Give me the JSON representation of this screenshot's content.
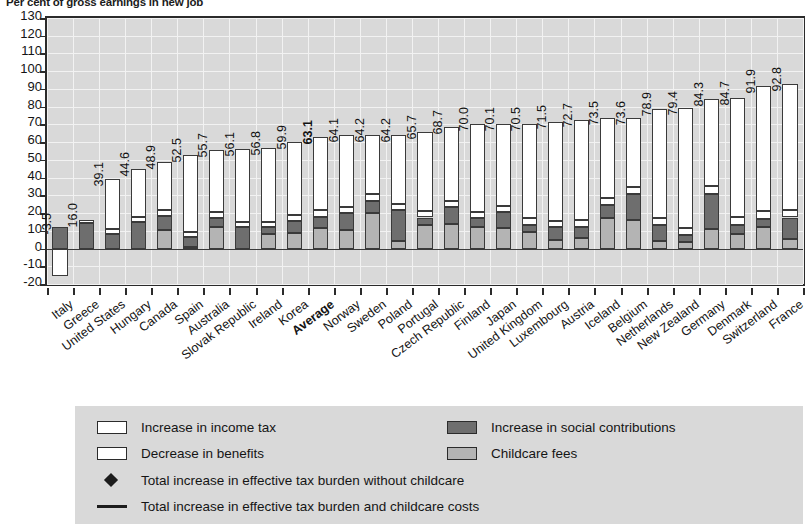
{
  "chart_data": {
    "type": "bar",
    "title": "Per cent of gross earnings in new job",
    "xlabel": "",
    "ylabel": "",
    "ylim": [
      -20,
      130
    ],
    "ytick_step": 10,
    "yticks": [
      130,
      120,
      110,
      100,
      90,
      80,
      70,
      60,
      50,
      40,
      30,
      20,
      10,
      0,
      -10,
      -20
    ],
    "grid": true,
    "legend_position": "below",
    "stacked": true,
    "highlight_category": "Average",
    "categories": [
      "Italy",
      "Greece",
      "United States",
      "Hungary",
      "Canada",
      "Spain",
      "Australia",
      "Slovak Republic",
      "Ireland",
      "Korea",
      "Average",
      "Norway",
      "Sweden",
      "Poland",
      "Portugal",
      "Czech Republic",
      "Finland",
      "Japan",
      "United Kingdom",
      "Luxembourg",
      "Austria",
      "Iceland",
      "Belgium",
      "Netherlands",
      "New Zealand",
      "Germany",
      "Denmark",
      "Switzerland",
      "France"
    ],
    "totals": [
      -3.5,
      16.0,
      39.1,
      44.6,
      48.9,
      52.5,
      55.7,
      56.1,
      56.8,
      59.9,
      63.1,
      64.1,
      64.2,
      64.2,
      65.7,
      68.7,
      70.0,
      70.1,
      70.5,
      71.5,
      72.7,
      73.5,
      73.6,
      78.9,
      79.4,
      84.3,
      84.7,
      91.9,
      92.8
    ],
    "total_labels": [
      "-3.5",
      "16.0",
      "39.1",
      "44.6",
      "48.9",
      "52.5",
      "55.7",
      "56.1",
      "56.8",
      "59.9",
      "63.1",
      "64.1",
      "64.2",
      "64.2",
      "65.7",
      "68.7",
      "70.0",
      "70.1",
      "70.5",
      "71.5",
      "72.7",
      "73.5",
      "73.6",
      "78.9",
      "79.4",
      "84.3",
      "84.7",
      "91.9",
      "92.8"
    ],
    "series": [
      {
        "name": "Childcare fees",
        "color": "#b4b4b4",
        "values": [
          0.0,
          0.0,
          0.0,
          0.0,
          10.5,
          1.0,
          12.0,
          0.0,
          8.0,
          9.0,
          11.5,
          10.5,
          20.0,
          4.5,
          13.0,
          14.0,
          12.0,
          11.5,
          9.5,
          5.0,
          6.0,
          17.0,
          16.0,
          4.5,
          3.5,
          11.0,
          8.0,
          12.0,
          5.5
        ]
      },
      {
        "name": "Increase in social contributions",
        "color": "#6e6e6e",
        "values": [
          12.0,
          14.5,
          8.0,
          15.0,
          8.0,
          5.5,
          5.0,
          12.0,
          4.0,
          6.5,
          6.5,
          9.5,
          7.0,
          17.0,
          4.5,
          9.5,
          5.0,
          9.0,
          4.0,
          7.0,
          6.0,
          7.5,
          14.5,
          8.5,
          4.0,
          20.0,
          5.5,
          4.5,
          12.0
        ]
      },
      {
        "name": "Increase in income tax",
        "color": "#ffffff",
        "values": [
          0.0,
          1.5,
          3.0,
          3.0,
          3.5,
          3.0,
          3.5,
          3.0,
          3.0,
          3.5,
          3.5,
          3.5,
          3.5,
          3.5,
          3.5,
          3.5,
          3.5,
          3.5,
          3.5,
          3.5,
          4.0,
          4.0,
          4.0,
          4.0,
          4.0,
          4.5,
          4.5,
          4.5,
          4.5
        ]
      },
      {
        "name": "Decrease in benefits",
        "color": "#ffffff",
        "values": [
          -15.5,
          0.0,
          28.1,
          26.6,
          26.9,
          43.0,
          35.2,
          41.1,
          41.8,
          40.9,
          41.6,
          40.6,
          33.7,
          39.2,
          44.7,
          41.7,
          49.5,
          46.1,
          53.5,
          56.0,
          56.7,
          45.0,
          39.1,
          61.9,
          67.9,
          48.8,
          66.7,
          70.9,
          70.8
        ]
      }
    ],
    "legend": [
      {
        "label": "Increase in income tax",
        "kind": "swatch",
        "swatch": "income"
      },
      {
        "label": "Decrease in benefits",
        "kind": "swatch",
        "swatch": "benefits"
      },
      {
        "label": "Increase in social contributions",
        "kind": "swatch",
        "swatch": "social"
      },
      {
        "label": "Childcare fees",
        "kind": "swatch",
        "swatch": "child"
      },
      {
        "label": "Total increase in effective tax burden without childcare",
        "kind": "diamond"
      },
      {
        "label": "Total increase in effective tax burden and childcare costs",
        "kind": "line"
      }
    ]
  },
  "colors": {
    "plot_background": "#d9d9d9",
    "legend_background": "#d9d9d9",
    "axis": "#2b2b2b",
    "gridline": "#f2f2f2",
    "income_tax": "#ffffff",
    "benefits": "#ffffff",
    "social_contributions": "#6e6e6e",
    "childcare_fees": "#b4b4b4",
    "text": "#141414"
  }
}
